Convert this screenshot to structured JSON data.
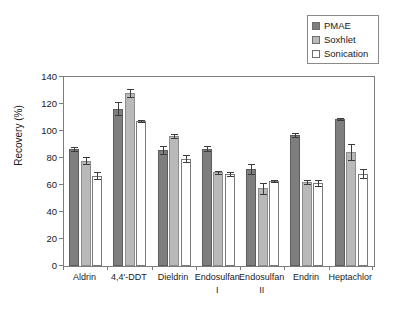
{
  "chart_data": {
    "type": "bar",
    "title": "",
    "subtitle": "",
    "xlabel": "",
    "ylabel": "Recovery (%)",
    "ylim": [
      0,
      140
    ],
    "ytick_values": [
      0,
      20,
      40,
      60,
      80,
      100,
      120,
      140
    ],
    "ytick_labels": [
      "0",
      "20",
      "40",
      "60",
      "80",
      "100",
      "120",
      "140"
    ],
    "grid": false,
    "legend_position": "top-right",
    "categories": [
      "Aldrin",
      "4,4'-DDT",
      "Dieldrin",
      "Endosulfan I",
      "Endosulfan II",
      "Endrin",
      "Heptachlor"
    ],
    "category_lines": [
      [
        "Aldrin",
        ""
      ],
      [
        "4,4'-DDT",
        ""
      ],
      [
        "Dieldrin",
        ""
      ],
      [
        "Endosulfan",
        "I"
      ],
      [
        "Endosulfan",
        "II"
      ],
      [
        "Endrin",
        ""
      ],
      [
        "Heptachlor",
        ""
      ]
    ],
    "series": [
      {
        "name": "PMAE",
        "color": "#7e7e7e",
        "values": [
          87,
          116.5,
          86,
          87,
          72,
          97,
          109
        ],
        "errors": [
          1.5,
          5,
          3,
          2,
          3.5,
          1.5,
          1
        ]
      },
      {
        "name": "Soxhlet",
        "color": "#b9b9b9",
        "values": [
          78,
          128,
          96,
          69.5,
          57.5,
          62.5,
          84.5
        ],
        "errors": [
          2.5,
          3,
          1.5,
          1,
          4,
          1.5,
          6
        ]
      },
      {
        "name": "Sonication",
        "color": "#ffffff",
        "values": [
          67,
          107.5,
          79.5,
          68.5,
          63,
          61.5,
          68.5
        ],
        "errors": [
          2.5,
          1,
          2.5,
          1.5,
          1,
          2,
          3
        ]
      }
    ]
  },
  "legend": {
    "items": [
      {
        "label": "PMAE",
        "swatch_color": "#7e7e7e"
      },
      {
        "label": "Soxhlet",
        "swatch_color": "#b9b9b9"
      },
      {
        "label": "Sonication",
        "swatch_color": "#ffffff"
      }
    ]
  },
  "axis": {
    "y_title": "Recovery (%)"
  }
}
